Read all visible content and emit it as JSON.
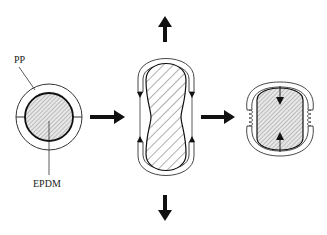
{
  "diagram": {
    "labels": {
      "pp": "PP",
      "epdm": "EPDM"
    },
    "stages": [
      {
        "name": "initial",
        "description": "PP shell around EPDM core"
      },
      {
        "name": "stretched",
        "description": "Elongated under tension"
      },
      {
        "name": "recovered",
        "description": "Compressed core with buckled shell"
      }
    ],
    "colors": {
      "stroke": "#1a1a1a",
      "core_fill": "#e6e6e6",
      "hatch": "#555555",
      "background": "#ffffff"
    }
  }
}
